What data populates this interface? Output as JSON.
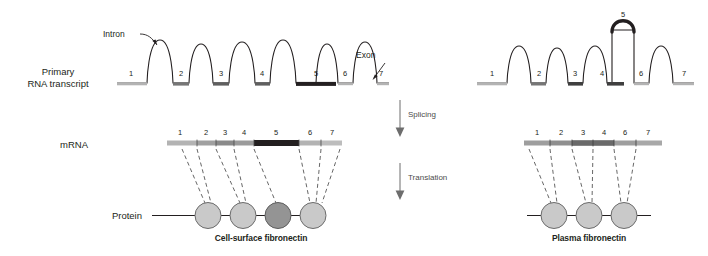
{
  "figure": {
    "title_left": "Cell-surface fibronectin",
    "title_right": "Plasma fibronectin"
  },
  "row_labels": {
    "primary_line1": "Primary",
    "primary_line2": "RNA transcript",
    "mrna": "mRNA",
    "protein": "Protein"
  },
  "annotations": {
    "intron": "Intron",
    "exon": "Exon",
    "splicing": "Splicing",
    "translation": "Translation"
  },
  "left_branch": {
    "primary_transcript_exons": [
      "1",
      "2",
      "3",
      "4",
      "5",
      "6",
      "7"
    ],
    "mrna_exons": [
      "1",
      "2",
      "3",
      "4",
      "5",
      "6",
      "7"
    ],
    "protein_domains": 4,
    "highlighted_exon": "5",
    "caption": "Cell-surface fibronectin"
  },
  "right_branch": {
    "primary_transcript_exons": [
      "1",
      "2",
      "3",
      "4",
      "5",
      "6",
      "7"
    ],
    "spliced_out_exon": "5",
    "mrna_exons": [
      "1",
      "2",
      "3",
      "4",
      "6",
      "7"
    ],
    "protein_domains": 3,
    "caption": "Plasma fibronectin"
  },
  "colors": {
    "exon_light": "#b3b3b3",
    "exon_mid": "#767676",
    "exon_dark": "#231f20",
    "stroke": "#231f20",
    "circle_light": "#c9c9c9",
    "circle_dark": "#949494",
    "arrow_gray": "#6d6d6d",
    "dash_gray": "#555555"
  }
}
